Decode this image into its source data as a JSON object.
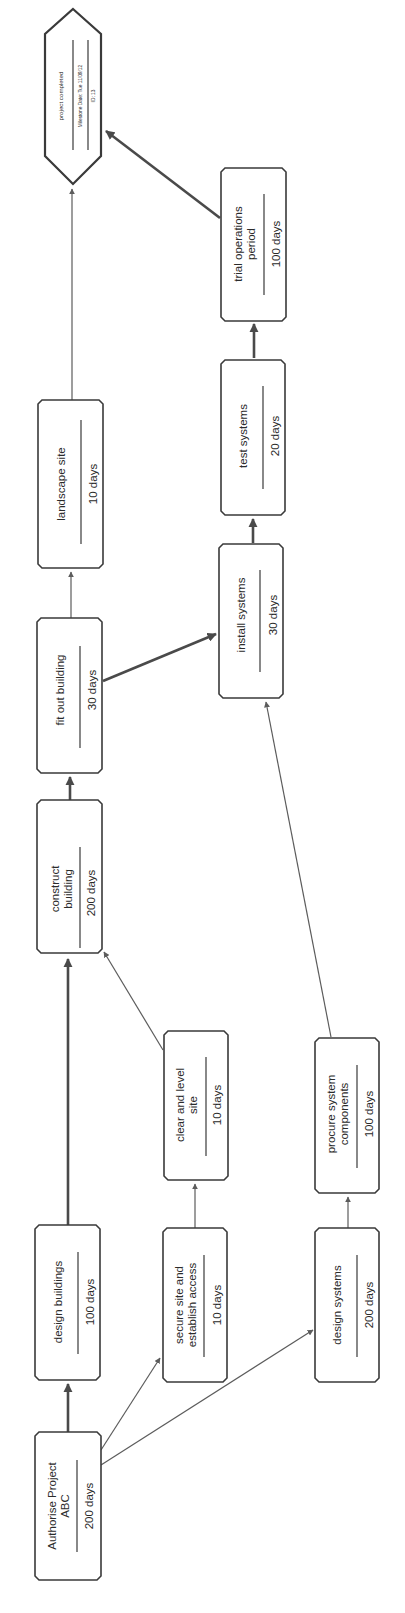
{
  "diagram": {
    "orientation": "rotated-90-ccw",
    "nodes": [
      {
        "id": "authorise",
        "lines": [
          "Authorise Project",
          "ABC"
        ],
        "duration": "200 days",
        "critical": true
      },
      {
        "id": "design_buildings",
        "lines": [
          "design buildings"
        ],
        "duration": "100 days",
        "critical": true
      },
      {
        "id": "construct_building",
        "lines": [
          "construct",
          "building"
        ],
        "duration": "200 days",
        "critical": true
      },
      {
        "id": "fit_out_building",
        "lines": [
          "fit out building"
        ],
        "duration": "30 days",
        "critical": true
      },
      {
        "id": "landscape_site",
        "lines": [
          "landscape site"
        ],
        "duration": "10 days",
        "critical": false
      },
      {
        "id": "secure_site",
        "lines": [
          "secure site and",
          "establish access"
        ],
        "duration": "10 days",
        "critical": false
      },
      {
        "id": "clear_level_site",
        "lines": [
          "clear and level",
          "site"
        ],
        "duration": "10 days",
        "critical": false
      },
      {
        "id": "design_systems",
        "lines": [
          "design systems"
        ],
        "duration": "200 days",
        "critical": false
      },
      {
        "id": "procure_components",
        "lines": [
          "procure system",
          "components"
        ],
        "duration": "100 days",
        "critical": false
      },
      {
        "id": "install_systems",
        "lines": [
          "install systems"
        ],
        "duration": "30 days",
        "critical": true
      },
      {
        "id": "test_systems",
        "lines": [
          "test systems"
        ],
        "duration": "20 days",
        "critical": true
      },
      {
        "id": "trial_operations",
        "lines": [
          "trial operations",
          "period"
        ],
        "duration": "100 days",
        "critical": true
      }
    ],
    "milestone": {
      "label": "project completed",
      "date": "Milestone Date: Tue 11/09/12",
      "id_text": "ID: 13"
    },
    "edges": [
      {
        "from": "authorise",
        "to": "design_buildings",
        "critical": true
      },
      {
        "from": "authorise",
        "to": "secure_site",
        "critical": false
      },
      {
        "from": "authorise",
        "to": "design_systems",
        "critical": false
      },
      {
        "from": "design_buildings",
        "to": "construct_building",
        "critical": true
      },
      {
        "from": "secure_site",
        "to": "clear_level_site",
        "critical": false
      },
      {
        "from": "clear_level_site",
        "to": "construct_building",
        "critical": false
      },
      {
        "from": "construct_building",
        "to": "fit_out_building",
        "critical": true
      },
      {
        "from": "fit_out_building",
        "to": "landscape_site",
        "critical": false
      },
      {
        "from": "fit_out_building",
        "to": "install_systems",
        "critical": true
      },
      {
        "from": "design_systems",
        "to": "procure_components",
        "critical": false
      },
      {
        "from": "procure_components",
        "to": "install_systems",
        "critical": false
      },
      {
        "from": "install_systems",
        "to": "test_systems",
        "critical": true
      },
      {
        "from": "test_systems",
        "to": "trial_operations",
        "critical": true
      },
      {
        "from": "landscape_site",
        "to": "milestone",
        "critical": false
      },
      {
        "from": "trial_operations",
        "to": "milestone",
        "critical": true
      }
    ],
    "colors": {
      "stroke": "#3a3a3a",
      "edge": "#5c5c5c",
      "background": "#ffffff"
    }
  }
}
